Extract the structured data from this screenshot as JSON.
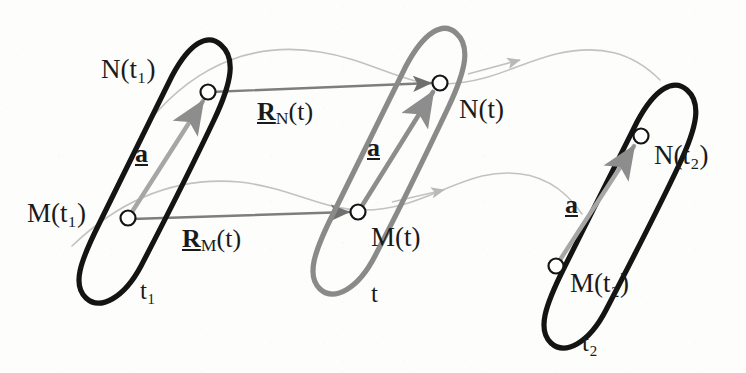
{
  "figure": {
    "background_color": "#fdfdfc",
    "ink_dark": "#141414",
    "ink_gray": "#8a8a8a",
    "ink_faint": "#bcbcbc"
  },
  "labels": {
    "n_t1": "N(t₁)",
    "m_t1": "M(t₁)",
    "t1": "t₁",
    "n_t": "N(t)",
    "m_t": "M(t)",
    "t": "t",
    "n_t2": "N(t₂)",
    "m_t2": "M(t₂)",
    "t2": "t₂",
    "a_left": "a",
    "a_mid": "a",
    "a_right": "a",
    "r_n_symbol": "R",
    "r_n_sub": "N",
    "r_n_arg": "(t)",
    "r_m_symbol": "R",
    "r_m_sub": "M",
    "r_m_arg": "(t)"
  },
  "nodes": [
    {
      "name": "N(t₁)",
      "x": 208,
      "y": 92
    },
    {
      "name": "M(t₁)",
      "x": 128,
      "y": 218
    },
    {
      "name": "N(t)",
      "x": 440,
      "y": 83
    },
    {
      "name": "M(t)",
      "x": 358,
      "y": 212
    },
    {
      "name": "N(t₂)",
      "x": 641,
      "y": 136
    },
    {
      "name": "M(t₂)",
      "x": 556,
      "y": 266
    }
  ],
  "bodies": [
    {
      "name": "body-t1",
      "color": "#141414",
      "center_x": 155,
      "center_y": 175
    },
    {
      "name": "body-t",
      "color": "#8a8a8a",
      "center_x": 389,
      "center_y": 168
    },
    {
      "name": "body-t2",
      "color": "#141414",
      "center_x": 594,
      "center_y": 222
    }
  ],
  "vectors": [
    {
      "name": "a-t1",
      "from": "M(t₁)",
      "to": "N(t₁)",
      "label": "a"
    },
    {
      "name": "a-t",
      "from": "M(t)",
      "to": "N(t)",
      "label": "a"
    },
    {
      "name": "a-t2",
      "from": "M(t₂)",
      "to": "N(t₂)",
      "label": "a"
    },
    {
      "name": "R_N",
      "from": "N(t₁)",
      "to": "N(t)",
      "label": "R_N(t)"
    },
    {
      "name": "R_M",
      "from": "M(t₁)",
      "to": "M(t)",
      "label": "R_M(t)"
    }
  ],
  "trajectories": [
    {
      "name": "trajectory-N",
      "through": [
        "N(t₁)",
        "N(t)",
        "N(t₂)"
      ]
    },
    {
      "name": "trajectory-M",
      "through": [
        "M(t₁)",
        "M(t)",
        "M(t₂)"
      ]
    }
  ]
}
